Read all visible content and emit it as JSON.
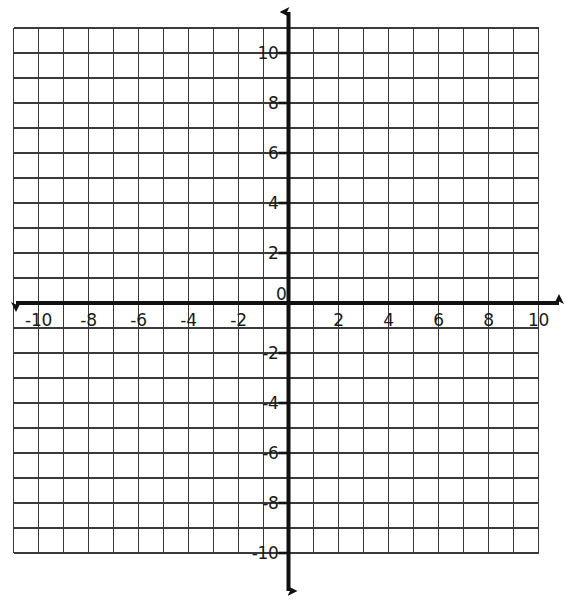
{
  "chart_data": {
    "type": "line",
    "title": "",
    "subtitle": "",
    "xlabel": "",
    "ylabel": "",
    "series": [],
    "x": [],
    "values": [],
    "grid": true,
    "legend_position": "none",
    "xlim": [
      -11,
      10
    ],
    "ylim": [
      -10,
      11
    ],
    "axis_range_labeled": [
      -10,
      10
    ],
    "x_tick_labels": [
      "-10",
      "-8",
      "-6",
      "-4",
      "-2",
      "2",
      "4",
      "6",
      "8",
      "10"
    ],
    "x_tick_values": [
      -10,
      -8,
      -6,
      -4,
      -2,
      2,
      4,
      6,
      8,
      10
    ],
    "y_tick_labels": [
      "10",
      "8",
      "6",
      "4",
      "2",
      "-2",
      "-4",
      "-6",
      "-8",
      "-10"
    ],
    "y_tick_values": [
      10,
      8,
      6,
      4,
      2,
      -2,
      -4,
      -6,
      -8,
      -10
    ],
    "origin_label": "0",
    "minor_grid_step": 1,
    "label_step": 2,
    "annotations": []
  },
  "graph": {
    "origin_label": "0",
    "axis_color": "#111111",
    "grid_color": "#3a3a3a",
    "background_color": "#ffffff",
    "label_color": "#1a1a1a",
    "x_axis_name": "x-axis",
    "y_axis_name": "y-axis",
    "x_labels": [
      {
        "text": "-10",
        "value": -10
      },
      {
        "text": "-8",
        "value": -8
      },
      {
        "text": "-6",
        "value": -6
      },
      {
        "text": "-4",
        "value": -4
      },
      {
        "text": "-2",
        "value": -2
      },
      {
        "text": "2",
        "value": 2
      },
      {
        "text": "4",
        "value": 4
      },
      {
        "text": "6",
        "value": 6
      },
      {
        "text": "8",
        "value": 8
      },
      {
        "text": "10",
        "value": 10
      }
    ],
    "y_labels": [
      {
        "text": "10",
        "value": 10
      },
      {
        "text": "8",
        "value": 8
      },
      {
        "text": "6",
        "value": 6
      },
      {
        "text": "4",
        "value": 4
      },
      {
        "text": "2",
        "value": 2
      },
      {
        "text": "-2",
        "value": -2
      },
      {
        "text": "-4",
        "value": -4
      },
      {
        "text": "-6",
        "value": -6
      },
      {
        "text": "-8",
        "value": -8
      },
      {
        "text": "-10",
        "value": -10
      }
    ]
  }
}
